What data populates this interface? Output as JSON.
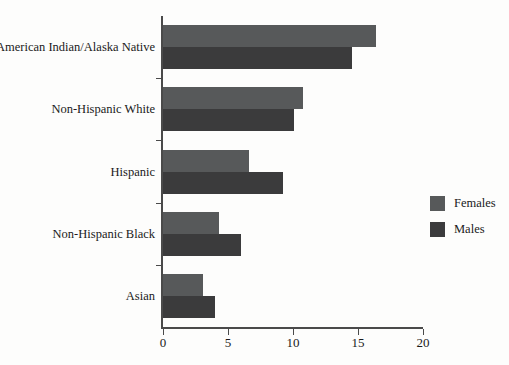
{
  "chart_data": {
    "type": "bar",
    "orientation": "horizontal",
    "title": "",
    "subtitle": "",
    "xlabel": "",
    "ylabel": "",
    "categories": [
      "American Indian/Alaska Native",
      "Non-Hispanic White",
      "Hispanic",
      "Non-Hispanic Black",
      "Asian"
    ],
    "series": [
      {
        "name": "Females",
        "color": "#57595a",
        "values": [
          16.4,
          10.8,
          6.6,
          4.3,
          3.1
        ]
      },
      {
        "name": "Males",
        "color": "#3b3b3c",
        "values": [
          14.5,
          10.1,
          9.2,
          6.0,
          4.0
        ]
      }
    ],
    "xlim": [
      0,
      20
    ],
    "xticks": [
      0,
      5,
      10,
      15,
      20
    ],
    "xtick_labels": [
      "0",
      "5",
      "10",
      "15",
      "20"
    ],
    "grid": false,
    "legend_position": "right"
  },
  "legend": {
    "items": [
      {
        "label": "Females",
        "color": "#57595a"
      },
      {
        "label": "Males",
        "color": "#3b3b3c"
      }
    ]
  },
  "colors": {
    "females": "#57595a",
    "males": "#3b3b3c",
    "axis": "#4a4a4a",
    "background": "#fdfdfc",
    "text": "#1a1a1a"
  }
}
